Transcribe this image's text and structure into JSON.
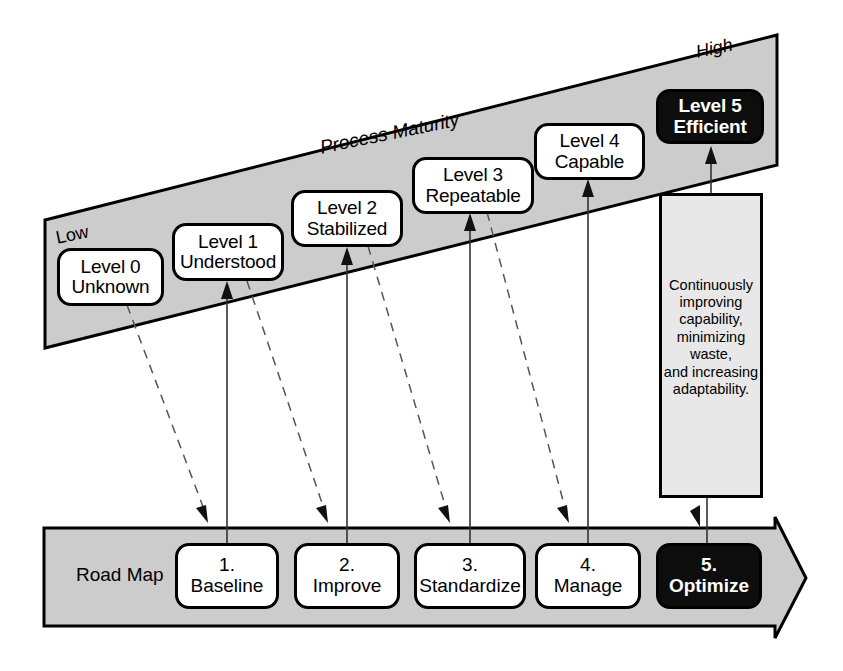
{
  "diagram": {
    "maturity_band": {
      "axis_label": "Process Maturity",
      "low_label": "Low",
      "high_label": "High",
      "fill_color": "#cccccc",
      "levels": [
        {
          "id": "level-0",
          "line1": "Level 0",
          "line2": "Unknown",
          "style": "light"
        },
        {
          "id": "level-1",
          "line1": "Level 1",
          "line2": "Understood",
          "style": "light"
        },
        {
          "id": "level-2",
          "line1": "Level 2",
          "line2": "Stabilized",
          "style": "light"
        },
        {
          "id": "level-3",
          "line1": "Level 3",
          "line2": "Repeatable",
          "style": "light"
        },
        {
          "id": "level-4",
          "line1": "Level 4",
          "line2": "Capable",
          "style": "light"
        },
        {
          "id": "level-5",
          "line1": "Level 5",
          "line2": "Efficient",
          "style": "dark"
        }
      ]
    },
    "road_map": {
      "label": "Road Map",
      "fill_color": "#cccccc",
      "steps": [
        {
          "id": "step-1",
          "number": "1.",
          "name": "Baseline",
          "style": "light"
        },
        {
          "id": "step-2",
          "number": "2.",
          "name": "Improve",
          "style": "light"
        },
        {
          "id": "step-3",
          "number": "3.",
          "name": "Standardize",
          "style": "light"
        },
        {
          "id": "step-4",
          "number": "4.",
          "name": "Manage",
          "style": "light"
        },
        {
          "id": "step-5",
          "number": "5.",
          "name": "Optimize",
          "style": "dark"
        }
      ]
    },
    "callout": {
      "fill_color": "#e8e8e8",
      "lines": [
        "Continuously",
        "improving",
        "capability,",
        "minimizing",
        "waste,",
        "and increasing",
        "adaptability."
      ]
    }
  }
}
